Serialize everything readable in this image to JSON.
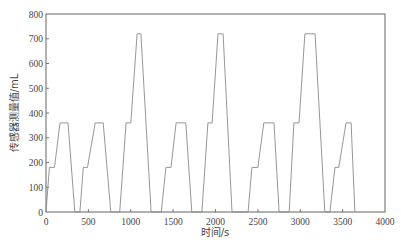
{
  "chart_data": {
    "type": "line",
    "title": "",
    "xlabel": "时间/s",
    "ylabel": "传感器测量值/mL",
    "xlim": [
      0,
      4000
    ],
    "ylim": [
      0,
      800
    ],
    "xticks": [
      0,
      500,
      1000,
      1500,
      2000,
      2500,
      3000,
      3500,
      4000
    ],
    "yticks": [
      0,
      100,
      200,
      300,
      400,
      500,
      600,
      700,
      800
    ],
    "grid": false,
    "legend": null,
    "series": [
      {
        "name": "传感器测量值",
        "color": "#8a8a8a",
        "points": [
          [
            0,
            0
          ],
          [
            40,
            180
          ],
          [
            100,
            180
          ],
          [
            165,
            360
          ],
          [
            260,
            360
          ],
          [
            340,
            0
          ],
          [
            400,
            0
          ],
          [
            440,
            180
          ],
          [
            490,
            180
          ],
          [
            580,
            360
          ],
          [
            675,
            360
          ],
          [
            765,
            0
          ],
          [
            870,
            0
          ],
          [
            945,
            360
          ],
          [
            1000,
            360
          ],
          [
            1075,
            720
          ],
          [
            1120,
            720
          ],
          [
            1240,
            0
          ],
          [
            1360,
            0
          ],
          [
            1415,
            180
          ],
          [
            1475,
            180
          ],
          [
            1535,
            360
          ],
          [
            1650,
            360
          ],
          [
            1720,
            0
          ],
          [
            1840,
            0
          ],
          [
            1910,
            360
          ],
          [
            1960,
            360
          ],
          [
            2030,
            720
          ],
          [
            2090,
            720
          ],
          [
            2195,
            0
          ],
          [
            2385,
            0
          ],
          [
            2430,
            180
          ],
          [
            2500,
            180
          ],
          [
            2570,
            360
          ],
          [
            2690,
            360
          ],
          [
            2750,
            0
          ],
          [
            2870,
            0
          ],
          [
            2925,
            360
          ],
          [
            2985,
            360
          ],
          [
            3055,
            720
          ],
          [
            3175,
            720
          ],
          [
            3290,
            0
          ],
          [
            3350,
            0
          ],
          [
            3410,
            180
          ],
          [
            3455,
            180
          ],
          [
            3540,
            360
          ],
          [
            3600,
            360
          ],
          [
            3645,
            0
          ]
        ]
      }
    ]
  },
  "labels": {
    "xlabel": "时间/s",
    "ylabel": "传感器测量值/mL"
  }
}
